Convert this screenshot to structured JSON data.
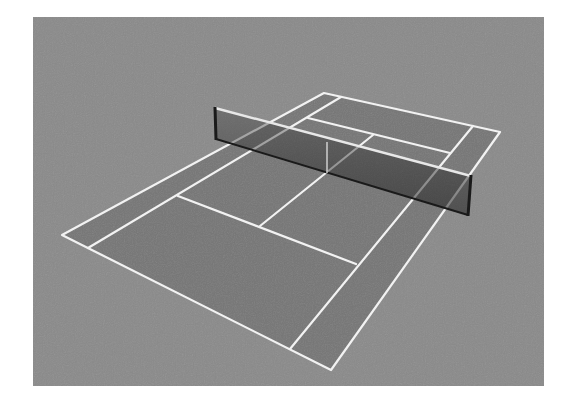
{
  "image": {
    "description": "Grayscale 3D render of a tennis court with net, viewed from an elevated corner angle",
    "subject": "tennis-court"
  },
  "colors": {
    "page_background": "#ffffff",
    "backdrop": "#8a8a8a",
    "court_surface": "#767676",
    "lines": "#f2f2f2",
    "net_mesh": "#4a4a4a",
    "net_posts": "#1a1a1a",
    "net_tape": "#e8e8e8"
  },
  "geometry": {
    "backdrop": {
      "x": 33,
      "y": 17,
      "w": 511,
      "h": 369
    },
    "doubles_corners": {
      "front_left": [
        62,
        235
      ],
      "front_right": [
        331,
        370
      ],
      "back_right": [
        500,
        132
      ],
      "back_left": [
        324,
        93
      ]
    },
    "singles_front": {
      "left": [
        88,
        248
      ],
      "right": [
        290,
        349
      ]
    },
    "singles_back": {
      "left": [
        341,
        97
      ],
      "right": [
        473,
        126
      ]
    },
    "service_line_front": {
      "from": [
        178,
        196
      ],
      "to": [
        356,
        264
      ]
    },
    "service_line_back": {
      "from": [
        308,
        118
      ],
      "to": [
        450,
        153
      ]
    },
    "center_service_line": {
      "from": [
        260,
        226
      ],
      "to": [
        373,
        135
      ]
    },
    "net": {
      "top_left": [
        215,
        108
      ],
      "top_right": [
        471,
        176
      ],
      "bottom_right": [
        468,
        215
      ],
      "bottom_left": [
        216,
        139
      ],
      "center_strap": {
        "top": [
          327,
          142
        ],
        "bottom": [
          327,
          173
        ]
      }
    }
  }
}
